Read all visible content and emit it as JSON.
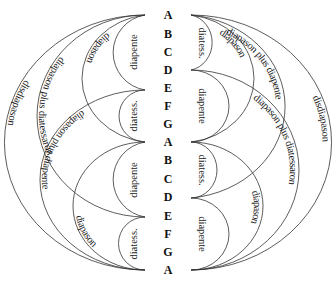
{
  "diagram": {
    "notes": [
      "A",
      "B",
      "C",
      "D",
      "E",
      "F",
      "G",
      "A",
      "B",
      "C",
      "D",
      "E",
      "F",
      "G",
      "A"
    ],
    "left": {
      "small": [
        "diapente",
        "diatess.",
        "diapente",
        "diatess."
      ],
      "diapason_upper": "diapason",
      "diapason_lower": "diapason",
      "diapason_plus_diatessaron": "diapason plus diatessaron",
      "diapason_plus_diapente": "diapason plus diapente",
      "disdiapason": "disdiapason"
    },
    "right": {
      "small": [
        "diatess.",
        "diapente",
        "diatess.",
        "diapente"
      ],
      "diapason_upper": "diapason",
      "diapason_lower": "diapason",
      "diapason_plus_diapente": "diapason plus diapente",
      "diapason_plus_diatessaron": "diapason plus diatessaron",
      "disdiapason": "disdiapason"
    },
    "colors": {
      "line": "#333333",
      "text": "#1a1a1a"
    }
  }
}
